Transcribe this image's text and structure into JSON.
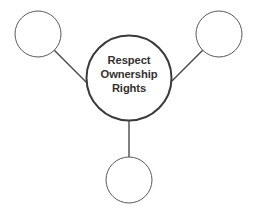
{
  "diagram": {
    "type": "hub-and-spoke",
    "background_color": "#ffffff",
    "hub": {
      "name": "center-node",
      "lines": [
        "Respect",
        "Ownership",
        "Rights"
      ],
      "text_color": "#33312f",
      "stroke_color": "#3a3a3a",
      "fill_color": "#ffffff",
      "stroke_width": 2,
      "cx": 129,
      "cy": 78,
      "r": 42.5
    },
    "satellites": [
      {
        "name": "node-top-left",
        "label": "",
        "stroke_color": "#595959",
        "fill_color": "#ffffff",
        "stroke_width": 1,
        "cx": 38,
        "cy": 34,
        "r": 23
      },
      {
        "name": "node-top-right",
        "label": "",
        "stroke_color": "#595959",
        "fill_color": "#ffffff",
        "stroke_width": 1,
        "cx": 219,
        "cy": 34,
        "r": 23
      },
      {
        "name": "node-bottom",
        "label": "",
        "stroke_color": "#595959",
        "fill_color": "#ffffff",
        "stroke_width": 1,
        "cx": 129,
        "cy": 180,
        "r": 23
      }
    ],
    "connectors": [
      {
        "name": "connector-top-left",
        "from": "node-top-left",
        "to": "center-node",
        "x1": 54.3,
        "y1": 50.3,
        "x2": 98.8,
        "y2": 94.8,
        "stroke_color": "#4a4a4a",
        "stroke_width": 1.4
      },
      {
        "name": "connector-top-right",
        "from": "node-top-right",
        "to": "center-node",
        "x1": 202.7,
        "y1": 50.3,
        "x2": 159.2,
        "y2": 93.8,
        "stroke_color": "#4a4a4a",
        "stroke_width": 1.4
      },
      {
        "name": "connector-bottom",
        "from": "center-node",
        "to": "node-bottom",
        "x1": 129,
        "y1": 120.5,
        "x2": 129,
        "y2": 157,
        "stroke_color": "#4a4a4a",
        "stroke_width": 1.4
      }
    ]
  }
}
